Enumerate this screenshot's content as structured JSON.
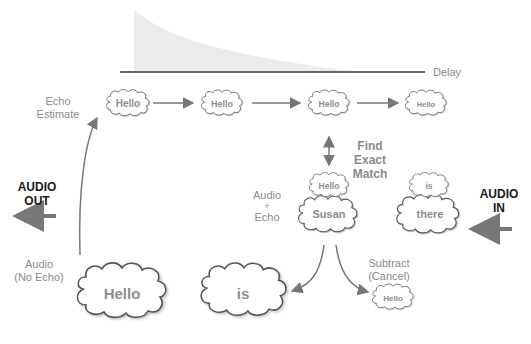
{
  "diagram": {
    "axis_label": "Delay",
    "labels": {
      "echo_estimate": [
        "Echo",
        "Estimate"
      ],
      "find_exact_match": [
        "Find",
        "Exact",
        "Match"
      ],
      "audio_plus_echo": [
        "Audio",
        "+",
        "Echo"
      ],
      "audio_no_echo": [
        "Audio",
        "(No Echo)"
      ],
      "subtract_cancel": [
        "Subtract",
        "(Cancel)"
      ],
      "audio_out": [
        "AUDIO",
        "OUT"
      ],
      "audio_in": [
        "AUDIO",
        "IN"
      ]
    },
    "echo_estimate_clouds": [
      "Hello",
      "Hello",
      "Hello",
      "Hello"
    ],
    "input_clouds": {
      "left_top": "Hello",
      "left_bottom": "Susan",
      "right_top": "is",
      "right_bottom": "there"
    },
    "output_clouds": {
      "no_echo": "Hello",
      "is": "is",
      "cancelled": "Hello"
    },
    "colors": {
      "line": "#333333",
      "arrow": "#777777",
      "text": "#8a8a8a",
      "decay_fill": "#ececec"
    }
  }
}
